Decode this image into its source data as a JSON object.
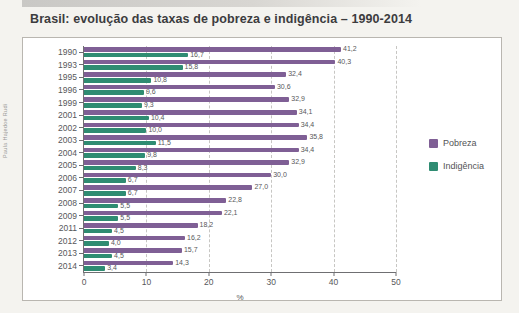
{
  "credit": "Paula Hajedoe Rudi",
  "title": "Brasil: evolução das taxas de pobreza e indigência – 1990-2014",
  "legend": {
    "pobreza": "Pobreza",
    "indigencia": "Indigência"
  },
  "colors": {
    "pobreza": "#7f5f95",
    "indigencia": "#2f8c72",
    "axis_text": "#57575a",
    "grid": "#c7c6c3"
  },
  "chart_data": {
    "type": "bar",
    "orientation": "horizontal",
    "title": "Brasil: evolução das taxas de pobreza e indigência – 1990-2014",
    "categories": [
      "1990",
      "1993",
      "1995",
      "1996",
      "1999",
      "2001",
      "2002",
      "2003",
      "2004",
      "2005",
      "2006",
      "2007",
      "2008",
      "2009",
      "2011",
      "2012",
      "2013",
      "2014"
    ],
    "series": [
      {
        "key": "pobreza",
        "name": "Pobreza",
        "color": "#7f5f95",
        "values": [
          41.2,
          40.3,
          32.4,
          30.6,
          32.9,
          34.1,
          34.4,
          35.8,
          34.4,
          32.9,
          30.0,
          27.0,
          22.8,
          22.1,
          18.2,
          16.2,
          15.7,
          14.3
        ],
        "labels": [
          "41,2",
          "40,3",
          "32,4",
          "30,6",
          "32,9",
          "34,1",
          "34,4",
          "35,8",
          "34,4",
          "32,9",
          "30,0",
          "27,0",
          "22,8",
          "22,1",
          "18,2",
          "16,2",
          "15,7",
          "14,3"
        ]
      },
      {
        "key": "indigencia",
        "name": "Indigência",
        "color": "#2f8c72",
        "values": [
          16.7,
          15.8,
          10.8,
          9.6,
          9.3,
          10.4,
          10.0,
          11.5,
          9.8,
          8.3,
          6.7,
          6.7,
          5.5,
          5.5,
          4.5,
          4.0,
          4.5,
          3.4
        ],
        "labels": [
          "16,7",
          "15,8",
          "10,8",
          "9,6",
          "9,3",
          "10,4",
          "10,0",
          "11,5",
          "9,8",
          "8,3",
          "6,7",
          "6,7",
          "5,5",
          "5,5",
          "4,5",
          "4,0",
          "4,5",
          "3,4"
        ]
      }
    ],
    "xlabel": "%",
    "xlim": [
      0,
      50
    ],
    "x_ticks": [
      "0",
      "10",
      "20",
      "30",
      "40",
      "50"
    ],
    "grid": "dashed-vertical",
    "legend_position": "right"
  }
}
